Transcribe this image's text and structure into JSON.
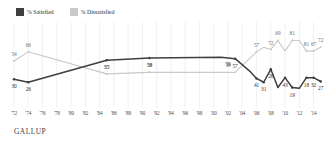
{
  "legend": {
    "items": [
      {
        "label": "% Satisfied",
        "key": "satisfied",
        "color": "#3f3f3f"
      },
      {
        "label": "% Dissatisfied",
        "key": "dissatisfied",
        "color": "#c9c9c9"
      }
    ]
  },
  "footer": {
    "brand": "GALLUP"
  },
  "chart_data": {
    "type": "line",
    "title": "",
    "subtitle": "",
    "xlabel": "",
    "ylabel": "",
    "ylim": [
      0,
      100
    ],
    "grid": "vertical",
    "legend_position": "top-left",
    "x_tick_labels": [
      "'72",
      "'74",
      "'76",
      "'78",
      "'80",
      "'82",
      "'84",
      "'86",
      "'88",
      "'90",
      "'92",
      "'94",
      "'96",
      "'98",
      "'00",
      "'02",
      "'04",
      "'06",
      "'08",
      "'10",
      "'12",
      "'14"
    ],
    "x_tick_years": [
      1972,
      1974,
      1976,
      1978,
      1980,
      1982,
      1984,
      1986,
      1988,
      1990,
      1992,
      1994,
      1996,
      1998,
      2000,
      2002,
      2004,
      2006,
      2008,
      2010,
      2012,
      2014
    ],
    "series": [
      {
        "name": "% Satisfied",
        "color": "#3f3f3f",
        "x": [
          1972,
          1974,
          1985,
          1991,
          2001,
          2003,
          2005,
          2006,
          2007,
          2008,
          2009,
          2010,
          2011,
          2012,
          2013,
          2014,
          2015
        ],
        "values": [
          30,
          26,
          55,
          58,
          59,
          57,
          41,
          31,
          26,
          43,
          19,
          32,
          19,
          18,
          32,
          32,
          27
        ]
      },
      {
        "name": "% Dissatisfied",
        "color": "#c9c9c9",
        "x": [
          1972,
          1974,
          1985,
          1991,
          2001,
          2003,
          2005,
          2006,
          2007,
          2008,
          2009,
          2010,
          2011,
          2012,
          2013,
          2014,
          2015
        ],
        "values": [
          54,
          66,
          37,
          39,
          39,
          39,
          57,
          66,
          72,
          69,
          81,
          67,
          81,
          81,
          67,
          67,
          72
        ]
      }
    ],
    "satisfied_labels": [
      {
        "value": 30,
        "x": 1972
      },
      {
        "value": 26,
        "x": 1974
      },
      {
        "value": 55,
        "x": 1985
      },
      {
        "value": 58,
        "x": 1991
      },
      {
        "value": 59,
        "x": 2002
      },
      {
        "value": 57,
        "x": 2003
      },
      {
        "value": 41,
        "x": 2006
      },
      {
        "value": 31,
        "x": 2007
      },
      {
        "value": 26,
        "x": 2008
      },
      {
        "value": 43,
        "x": 2010
      },
      {
        "value": 19,
        "x": 2011
      },
      {
        "value": 18,
        "x": 2013
      },
      {
        "value": 32,
        "x": 2014
      },
      {
        "value": 27,
        "x": 2015
      }
    ],
    "dissatisfied_labels": [
      {
        "value": 54,
        "x": 1972
      },
      {
        "value": 66,
        "x": 1974
      },
      {
        "value": 37,
        "x": 1985
      },
      {
        "value": 39,
        "x": 1991
      },
      {
        "value": 39,
        "x": 2002
      },
      {
        "value": 57,
        "x": 2006
      },
      {
        "value": 72,
        "x": 2008
      },
      {
        "value": 69,
        "x": 2009
      },
      {
        "value": 81,
        "x": 2011
      },
      {
        "value": 81,
        "x": 2013
      },
      {
        "value": 67,
        "x": 2014
      },
      {
        "value": 72,
        "x": 2015
      }
    ]
  }
}
